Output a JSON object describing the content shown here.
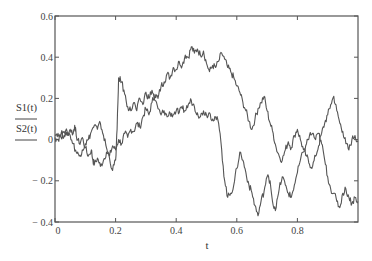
{
  "chart_data": {
    "type": "line",
    "title": "",
    "xlabel": "t",
    "ylabel": "",
    "legend": [
      "S1(t)",
      "S2(t)"
    ],
    "legend_position": "left of y-axis, stacked with underline",
    "xlim": [
      0,
      1
    ],
    "ylim": [
      -0.4,
      0.6
    ],
    "x_ticks": [
      0,
      0.2,
      0.4,
      0.6,
      0.8
    ],
    "x_tick_labels": [
      "0",
      "0.2",
      "0.4",
      "0.6",
      "0.8"
    ],
    "y_ticks": [
      0.6,
      0.4,
      0.2,
      0,
      -0.2,
      -0.4
    ],
    "y_tick_labels": [
      "0.6",
      "0.4",
      "0.2",
      "0",
      "− 0.2",
      "− 0.4"
    ],
    "grid": false,
    "line_color": "#555555",
    "series": [
      {
        "name": "S1(t)",
        "points": [
          [
            0.0,
            0.02
          ],
          [
            0.01,
            0.03
          ],
          [
            0.02,
            0.01
          ],
          [
            0.03,
            0.04
          ],
          [
            0.04,
            0.02
          ],
          [
            0.05,
            0.05
          ],
          [
            0.06,
            0.03
          ],
          [
            0.065,
            0.07
          ],
          [
            0.07,
            0.02
          ],
          [
            0.08,
            -0.02
          ],
          [
            0.09,
            0.01
          ],
          [
            0.1,
            -0.04
          ],
          [
            0.11,
            -0.08
          ],
          [
            0.12,
            -0.05
          ],
          [
            0.125,
            -0.1
          ],
          [
            0.13,
            -0.12
          ],
          [
            0.14,
            -0.09
          ],
          [
            0.15,
            -0.13
          ],
          [
            0.16,
            -0.1
          ],
          [
            0.17,
            -0.06
          ],
          [
            0.18,
            -0.08
          ],
          [
            0.19,
            -0.03
          ],
          [
            0.2,
            -0.05
          ],
          [
            0.21,
            0.0
          ],
          [
            0.22,
            -0.02
          ],
          [
            0.23,
            0.03
          ],
          [
            0.24,
            0.01
          ],
          [
            0.25,
            0.05
          ],
          [
            0.26,
            0.04
          ],
          [
            0.27,
            0.08
          ],
          [
            0.28,
            0.06
          ],
          [
            0.29,
            0.11
          ],
          [
            0.3,
            0.15
          ],
          [
            0.31,
            0.12
          ],
          [
            0.32,
            0.18
          ],
          [
            0.33,
            0.22
          ],
          [
            0.34,
            0.2
          ],
          [
            0.35,
            0.26
          ],
          [
            0.36,
            0.28
          ],
          [
            0.37,
            0.32
          ],
          [
            0.38,
            0.3
          ],
          [
            0.39,
            0.35
          ],
          [
            0.4,
            0.34
          ],
          [
            0.41,
            0.38
          ],
          [
            0.42,
            0.36
          ],
          [
            0.43,
            0.41
          ],
          [
            0.44,
            0.4
          ],
          [
            0.45,
            0.45
          ],
          [
            0.46,
            0.42
          ],
          [
            0.47,
            0.44
          ],
          [
            0.48,
            0.41
          ],
          [
            0.49,
            0.43
          ],
          [
            0.5,
            0.37
          ],
          [
            0.51,
            0.33
          ],
          [
            0.52,
            0.36
          ],
          [
            0.53,
            0.35
          ],
          [
            0.54,
            0.38
          ],
          [
            0.55,
            0.42
          ],
          [
            0.56,
            0.39
          ],
          [
            0.57,
            0.35
          ],
          [
            0.58,
            0.33
          ],
          [
            0.59,
            0.3
          ],
          [
            0.6,
            0.26
          ],
          [
            0.61,
            0.23
          ],
          [
            0.62,
            0.18
          ],
          [
            0.63,
            0.14
          ],
          [
            0.64,
            0.09
          ],
          [
            0.65,
            0.05
          ],
          [
            0.66,
            0.1
          ],
          [
            0.67,
            0.15
          ],
          [
            0.68,
            0.18
          ],
          [
            0.69,
            0.21
          ],
          [
            0.7,
            0.14
          ],
          [
            0.71,
            0.08
          ],
          [
            0.72,
            0.03
          ],
          [
            0.73,
            -0.04
          ],
          [
            0.74,
            -0.08
          ],
          [
            0.75,
            -0.1
          ],
          [
            0.76,
            -0.05
          ],
          [
            0.77,
            -0.01
          ],
          [
            0.78,
            -0.04
          ],
          [
            0.79,
            0.02
          ],
          [
            0.8,
            0.05
          ],
          [
            0.81,
            0.0
          ],
          [
            0.82,
            -0.05
          ],
          [
            0.83,
            -0.08
          ],
          [
            0.84,
            -0.12
          ],
          [
            0.85,
            -0.13
          ],
          [
            0.86,
            -0.08
          ],
          [
            0.87,
            -0.03
          ],
          [
            0.88,
            0.03
          ],
          [
            0.89,
            0.08
          ],
          [
            0.9,
            0.12
          ],
          [
            0.91,
            0.17
          ],
          [
            0.92,
            0.21
          ],
          [
            0.93,
            0.14
          ],
          [
            0.94,
            0.08
          ],
          [
            0.95,
            0.04
          ],
          [
            0.96,
            -0.02
          ],
          [
            0.97,
            -0.05
          ],
          [
            0.98,
            0.0
          ],
          [
            0.99,
            0.02
          ],
          [
            1.0,
            -0.01
          ]
        ]
      },
      {
        "name": "S2(t)",
        "points": [
          [
            0.0,
            0.01
          ],
          [
            0.01,
            0.0
          ],
          [
            0.02,
            0.03
          ],
          [
            0.03,
            0.02
          ],
          [
            0.04,
            0.04
          ],
          [
            0.05,
            0.02
          ],
          [
            0.06,
            -0.02
          ],
          [
            0.07,
            -0.06
          ],
          [
            0.08,
            -0.08
          ],
          [
            0.09,
            -0.05
          ],
          [
            0.1,
            -0.02
          ],
          [
            0.11,
            0.0
          ],
          [
            0.12,
            0.04
          ],
          [
            0.13,
            0.07
          ],
          [
            0.14,
            0.05
          ],
          [
            0.15,
            0.08
          ],
          [
            0.16,
            0.02
          ],
          [
            0.17,
            -0.04
          ],
          [
            0.18,
            -0.09
          ],
          [
            0.19,
            -0.15
          ],
          [
            0.2,
            -0.1
          ],
          [
            0.205,
            0.05
          ],
          [
            0.21,
            0.3
          ],
          [
            0.22,
            0.28
          ],
          [
            0.23,
            0.22
          ],
          [
            0.24,
            0.16
          ],
          [
            0.25,
            0.14
          ],
          [
            0.26,
            0.18
          ],
          [
            0.27,
            0.14
          ],
          [
            0.28,
            0.2
          ],
          [
            0.29,
            0.17
          ],
          [
            0.3,
            0.23
          ],
          [
            0.31,
            0.2
          ],
          [
            0.32,
            0.24
          ],
          [
            0.33,
            0.19
          ],
          [
            0.34,
            0.15
          ],
          [
            0.35,
            0.12
          ],
          [
            0.36,
            0.14
          ],
          [
            0.37,
            0.11
          ],
          [
            0.38,
            0.13
          ],
          [
            0.39,
            0.12
          ],
          [
            0.4,
            0.14
          ],
          [
            0.41,
            0.13
          ],
          [
            0.42,
            0.15
          ],
          [
            0.43,
            0.14
          ],
          [
            0.44,
            0.17
          ],
          [
            0.45,
            0.19
          ],
          [
            0.46,
            0.16
          ],
          [
            0.47,
            0.13
          ],
          [
            0.48,
            0.11
          ],
          [
            0.49,
            0.14
          ],
          [
            0.5,
            0.12
          ],
          [
            0.51,
            0.13
          ],
          [
            0.52,
            0.1
          ],
          [
            0.53,
            0.11
          ],
          [
            0.54,
            0.08
          ],
          [
            0.55,
            -0.05
          ],
          [
            0.56,
            -0.2
          ],
          [
            0.57,
            -0.28
          ],
          [
            0.58,
            -0.26
          ],
          [
            0.59,
            -0.22
          ],
          [
            0.6,
            -0.14
          ],
          [
            0.61,
            -0.06
          ],
          [
            0.62,
            -0.1
          ],
          [
            0.63,
            -0.16
          ],
          [
            0.64,
            -0.22
          ],
          [
            0.65,
            -0.26
          ],
          [
            0.66,
            -0.32
          ],
          [
            0.67,
            -0.37
          ],
          [
            0.68,
            -0.3
          ],
          [
            0.69,
            -0.25
          ],
          [
            0.7,
            -0.18
          ],
          [
            0.71,
            -0.2
          ],
          [
            0.72,
            -0.32
          ],
          [
            0.73,
            -0.33
          ],
          [
            0.74,
            -0.24
          ],
          [
            0.75,
            -0.18
          ],
          [
            0.76,
            -0.22
          ],
          [
            0.77,
            -0.26
          ],
          [
            0.78,
            -0.28
          ],
          [
            0.79,
            -0.22
          ],
          [
            0.8,
            -0.16
          ],
          [
            0.81,
            -0.1
          ],
          [
            0.82,
            -0.06
          ],
          [
            0.83,
            -0.02
          ],
          [
            0.84,
            0.02
          ],
          [
            0.85,
            0.03
          ],
          [
            0.86,
            0.0
          ],
          [
            0.87,
            0.03
          ],
          [
            0.88,
            -0.02
          ],
          [
            0.89,
            -0.1
          ],
          [
            0.9,
            -0.18
          ],
          [
            0.91,
            -0.24
          ],
          [
            0.92,
            -0.26
          ],
          [
            0.93,
            -0.3
          ],
          [
            0.94,
            -0.33
          ],
          [
            0.95,
            -0.26
          ],
          [
            0.96,
            -0.24
          ],
          [
            0.97,
            -0.28
          ],
          [
            0.98,
            -0.31
          ],
          [
            0.99,
            -0.28
          ],
          [
            1.0,
            -0.3
          ]
        ]
      }
    ]
  }
}
